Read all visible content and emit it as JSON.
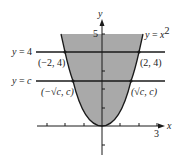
{
  "figure": {
    "type": "parabola-region-diagram",
    "curve_label": "y = x²",
    "curve_label_parts": {
      "y": "y",
      "eq": " = ",
      "x": "x",
      "exp": "2"
    },
    "axes": {
      "x_label": "x",
      "y_label": "y",
      "x_tick_label": "3",
      "y_tick_label": "5"
    },
    "horizontal_lines": [
      {
        "label": "y = 4",
        "label_y": "y",
        "label_rest": " = 4",
        "value": 4
      },
      {
        "label": "y = c",
        "label_y": "y",
        "label_eq": " = ",
        "label_c": "c",
        "value": "c"
      }
    ],
    "points": [
      {
        "label": "(−2, 4)",
        "x": -2,
        "y": 4
      },
      {
        "label": "(2, 4)",
        "x": 2,
        "y": 4
      },
      {
        "label": "(−√c, c)",
        "x": "-sqrt(c)",
        "y": "c"
      },
      {
        "label": "(√c, c)",
        "x": "sqrt(c)",
        "y": "c"
      }
    ],
    "colors": {
      "shade": "#a9a9a9",
      "line": "#1a1a1a",
      "background": "#ffffff"
    }
  }
}
